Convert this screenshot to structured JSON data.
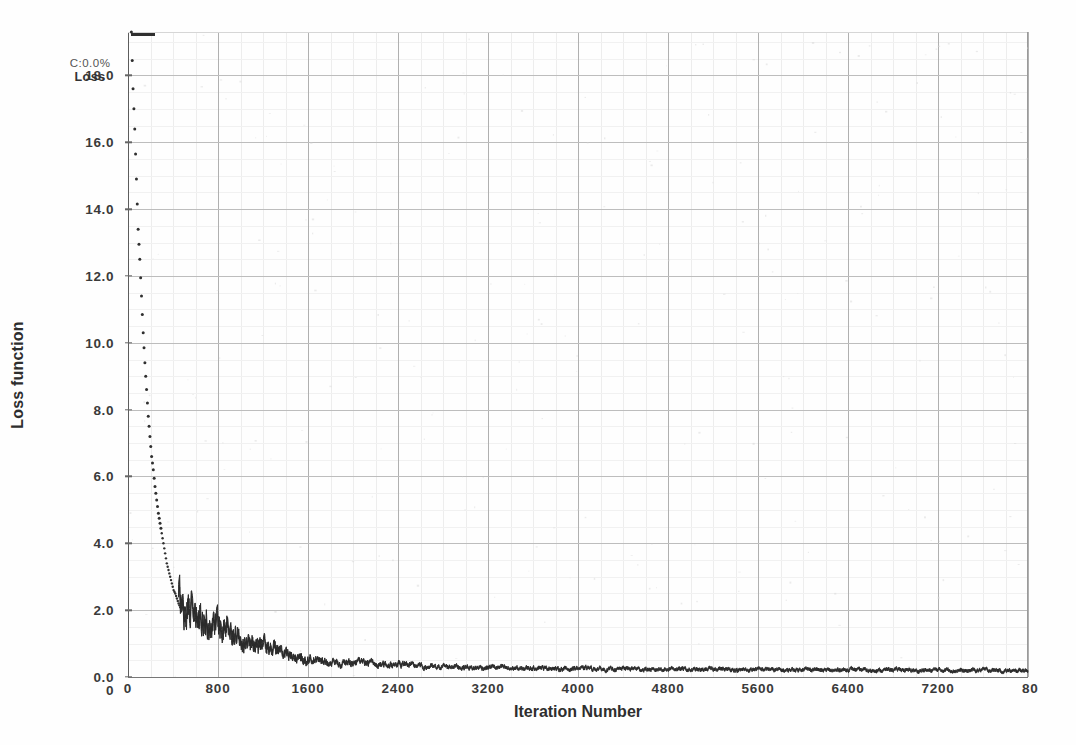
{
  "annotation": {
    "line1": "C:0.0%",
    "line2": "Loss"
  },
  "chart_data": {
    "type": "line",
    "title": "",
    "subtitle": "",
    "xlabel": "Iteration Number",
    "ylabel": "Loss function",
    "xlim": [
      0,
      8000
    ],
    "ylim": [
      0.0,
      19.3
    ],
    "grid": true,
    "legend": null,
    "annotations": [
      "C:0.0%",
      "Loss"
    ],
    "xticks": [
      0,
      800,
      1600,
      2400,
      3200,
      4000,
      4800,
      5600,
      6400,
      7200,
      8000
    ],
    "xtick_labels": [
      "0",
      "800",
      "1600",
      "2400",
      "3200",
      "4000",
      "4800",
      "5600",
      "6400",
      "7200",
      "80"
    ],
    "yticks": [
      0.0,
      2.0,
      4.0,
      6.0,
      8.0,
      10.0,
      12.0,
      14.0,
      16.0,
      18.0
    ],
    "ytick_labels": [
      "0.0",
      "2.0",
      "4.0",
      "6.0",
      "8.0",
      "10.0",
      "12.0",
      "14.0",
      "16.0",
      "18.0"
    ],
    "series": [
      {
        "name": "Loss",
        "color": "#2a2a2a",
        "style": "noisy-decay",
        "note": "Training loss decays steeply from ~19.3 at the first iterations to ~2.0 by iteration 500, then noisily to ~0.2 by iteration 8000.",
        "x": [
          30,
          45,
          60,
          75,
          90,
          105,
          120,
          135,
          150,
          165,
          180,
          195,
          210,
          225,
          240,
          255,
          270,
          285,
          300,
          315,
          330,
          345,
          360,
          375,
          390,
          405,
          420,
          435,
          450,
          470,
          490,
          510,
          540,
          580,
          640,
          720,
          800,
          900,
          1000,
          1100,
          1200,
          1300,
          1400,
          1500,
          1600,
          1800,
          2000,
          2200,
          2400,
          2600,
          2800,
          3000,
          3200,
          3400,
          3600,
          3800,
          4000,
          4400,
          4800,
          5200,
          5600,
          6000,
          6400,
          6800,
          7200,
          7600,
          8000
        ],
        "y": [
          19.3,
          17.6,
          16.4,
          14.9,
          13.4,
          12.5,
          11.4,
          10.3,
          9.4,
          8.6,
          7.8,
          7.2,
          6.6,
          6.2,
          5.7,
          5.3,
          4.9,
          4.6,
          4.3,
          4.0,
          3.7,
          3.4,
          3.2,
          3.0,
          2.8,
          2.6,
          2.5,
          2.35,
          2.2,
          2.05,
          1.95,
          1.9,
          2.0,
          1.85,
          1.8,
          1.7,
          1.6,
          1.35,
          1.2,
          1.1,
          0.95,
          0.8,
          0.7,
          0.6,
          0.5,
          0.45,
          0.42,
          0.4,
          0.38,
          0.33,
          0.3,
          0.3,
          0.28,
          0.27,
          0.26,
          0.26,
          0.25,
          0.24,
          0.23,
          0.23,
          0.22,
          0.22,
          0.21,
          0.21,
          0.2,
          0.2,
          0.19
        ]
      }
    ]
  }
}
